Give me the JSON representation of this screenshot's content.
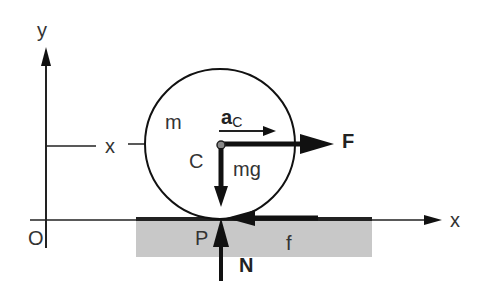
{
  "diagram": {
    "type": "free-body-diagram",
    "labels": {
      "y_axis": "y",
      "x_axis_upper": "x",
      "x_axis_lower": "x",
      "origin": "O",
      "mass": "m",
      "accel_main": "a",
      "accel_sub": "C",
      "center": "C",
      "weight": "mg",
      "force": "F",
      "contact_point": "P",
      "friction": "f",
      "normal": "N"
    },
    "colors": {
      "ink": "#111111",
      "ground": "#c8c8c8",
      "text": "#333333"
    }
  }
}
